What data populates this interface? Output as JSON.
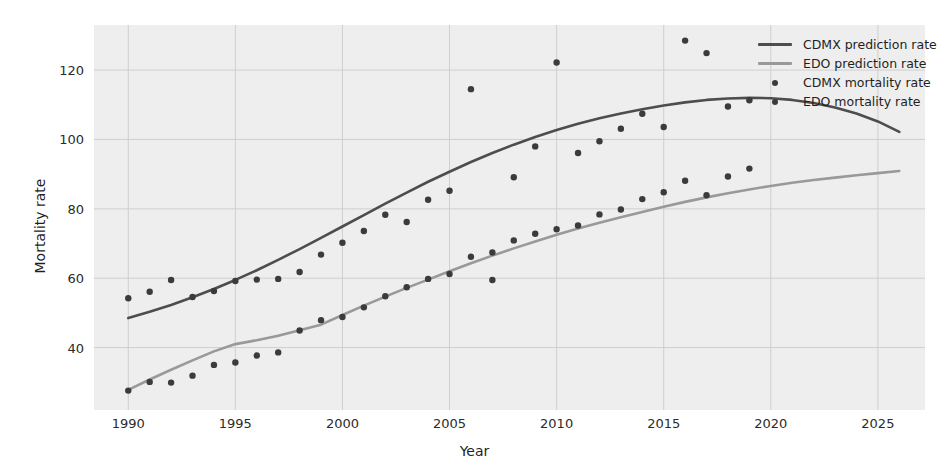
{
  "chart_data": {
    "type": "scatter",
    "title": "",
    "xlabel": "Year",
    "ylabel": "Mortality rate",
    "xlim": [
      1988.4,
      1990.0
    ],
    "x_range": [
      1988.4,
      2027.2
    ],
    "ylim": [
      22,
      133
    ],
    "grid": true,
    "legend_position": "upper right",
    "xticks": [
      1990,
      1995,
      2000,
      2005,
      2010,
      2015,
      2020,
      2025
    ],
    "yticks": [
      40,
      60,
      80,
      100,
      120
    ],
    "colors": {
      "cdmx_prediction": "#4d4d4d",
      "edo_prediction": "#999999",
      "cdmx_mortality": "#3b3b3b",
      "edo_mortality": "#3b3b3b",
      "plot_background": "#eeeeee",
      "grid": "#cfcfcf",
      "figure_background": "#ffffff"
    },
    "series": [
      {
        "name": "CDMX prediction rate",
        "kind": "line",
        "color": "#4d4d4d",
        "x": [
          1990,
          1991,
          1992,
          1993,
          1994,
          1995,
          1996,
          1997,
          1998,
          1999,
          2000,
          2001,
          2002,
          2003,
          2004,
          2005,
          2006,
          2007,
          2008,
          2009,
          2010,
          2011,
          2012,
          2013,
          2014,
          2015,
          2016,
          2017,
          2018,
          2019,
          2020,
          2021,
          2022,
          2023,
          2024,
          2025,
          2026
        ],
        "values": [
          48.5,
          50.3,
          52.3,
          54.5,
          56.9,
          59.5,
          62.3,
          65.3,
          68.4,
          71.6,
          74.9,
          78.2,
          81.5,
          84.7,
          87.8,
          90.7,
          93.5,
          96.1,
          98.5,
          100.7,
          102.7,
          104.5,
          106.1,
          107.5,
          108.7,
          109.8,
          110.7,
          111.4,
          111.8,
          112.0,
          111.9,
          111.4,
          110.5,
          109.2,
          107.5,
          105.2,
          102.2
        ]
      },
      {
        "name": "EDO prediction rate",
        "kind": "line",
        "color": "#999999",
        "x": [
          1990,
          1991,
          1992,
          1993,
          1994,
          1995,
          1996,
          1997,
          1998,
          1999,
          2000,
          2001,
          2002,
          2003,
          2004,
          2005,
          2006,
          2007,
          2008,
          2009,
          2010,
          2011,
          2012,
          2013,
          2014,
          2015,
          2016,
          2017,
          2018,
          2019,
          2020,
          2021,
          2022,
          2023,
          2024,
          2025,
          2026
        ],
        "values": [
          27.8,
          30.8,
          33.6,
          36.3,
          38.9,
          41.0,
          42.1,
          43.4,
          45.0,
          46.6,
          49.4,
          52.1,
          54.7,
          57.2,
          59.6,
          62.0,
          64.3,
          66.5,
          68.6,
          70.6,
          72.5,
          74.3,
          76.0,
          77.6,
          79.1,
          80.6,
          82.0,
          83.3,
          84.5,
          85.6,
          86.6,
          87.5,
          88.3,
          89.0,
          89.7,
          90.3,
          90.9
        ]
      },
      {
        "name": "CDMX mortality rate",
        "kind": "scatter",
        "color": "#3b3b3b",
        "x": [
          1990,
          1991,
          1992,
          1993,
          1994,
          1995,
          1996,
          1997,
          1998,
          1999,
          2000,
          2001,
          2002,
          2003,
          2004,
          2005,
          2006,
          2007,
          2008,
          2009,
          2010,
          2011,
          2012,
          2013,
          2014,
          2015,
          2016,
          2017,
          2018,
          2019
        ],
        "values": [
          54.2,
          56.1,
          59.5,
          54.6,
          56.3,
          59.2,
          59.6,
          59.8,
          61.8,
          66.8,
          70.2,
          73.6,
          78.3,
          76.2,
          82.6,
          85.2,
          114.5,
          59.5,
          89.1,
          98.0,
          122.2,
          96.1,
          99.5,
          103.1,
          107.4,
          103.6,
          128.5,
          124.9,
          109.5,
          111.3
        ]
      },
      {
        "name": "EDO mortality rate",
        "kind": "scatter",
        "color": "#3b3b3b",
        "x": [
          1990,
          1991,
          1992,
          1993,
          1994,
          1995,
          1996,
          1997,
          1998,
          1999,
          2000,
          2001,
          2002,
          2003,
          2004,
          2005,
          2006,
          2007,
          2008,
          2009,
          2010,
          2011,
          2012,
          2013,
          2014,
          2015,
          2016,
          2017,
          2018,
          2019
        ],
        "values": [
          27.6,
          30.1,
          29.9,
          31.9,
          35.0,
          35.7,
          37.7,
          38.6,
          44.9,
          47.9,
          48.8,
          51.6,
          54.8,
          57.4,
          59.8,
          61.2,
          66.2,
          67.4,
          70.9,
          72.8,
          74.1,
          75.2,
          78.4,
          79.8,
          82.8,
          84.8,
          88.1,
          83.9,
          89.3,
          91.6
        ]
      }
    ]
  },
  "axes": {
    "ylabel": "Mortality rate",
    "xlabel": "Year",
    "ytick_labels": [
      "40",
      "60",
      "80",
      "100",
      "120"
    ],
    "xtick_labels": [
      "1990",
      "1995",
      "2000",
      "2005",
      "2010",
      "2015",
      "2020",
      "2025"
    ]
  },
  "legend": {
    "items": [
      {
        "label": "CDMX prediction rate",
        "marker": "line",
        "color": "#4d4d4d"
      },
      {
        "label": "EDO prediction rate",
        "marker": "line",
        "color": "#999999"
      },
      {
        "label": "CDMX mortality rate",
        "marker": "dot",
        "color": "#3b3b3b"
      },
      {
        "label": "EDO mortality rate",
        "marker": "dot",
        "color": "#3b3b3b"
      }
    ]
  }
}
